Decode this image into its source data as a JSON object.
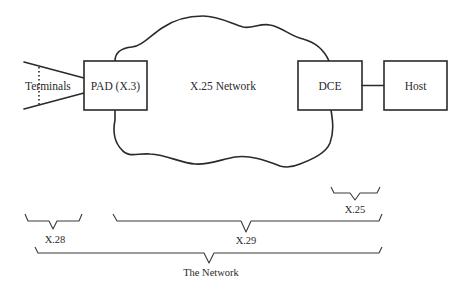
{
  "diagram": {
    "terminals_label": "Terminals",
    "pad_label": "PAD (X.3)",
    "network_label": "X.25 Network",
    "dce_label": "DCE",
    "host_label": "Host",
    "brackets": {
      "x25": "X.25",
      "x28": "X.28",
      "x29": "X.29",
      "network": "The Network"
    },
    "colors": {
      "line": "#2a2a2a",
      "background": "#ffffff"
    }
  }
}
